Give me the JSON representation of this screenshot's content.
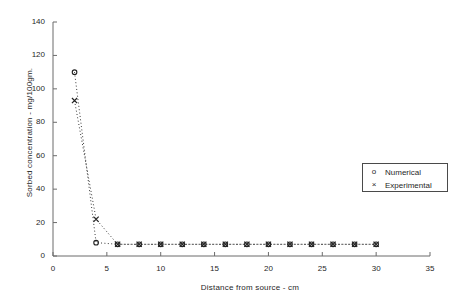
{
  "chart_data": {
    "type": "scatter",
    "title": "",
    "xlabel": "Distance from source  -  cm",
    "ylabel": "Sorbed concentration -  mg/100gm.",
    "xlim": [
      0,
      35
    ],
    "ylim": [
      0,
      140
    ],
    "xticks": [
      0,
      5,
      10,
      15,
      20,
      25,
      30,
      35
    ],
    "yticks": [
      0,
      20,
      40,
      60,
      80,
      100,
      120,
      140
    ],
    "xtick_labels": [
      "0",
      "5",
      "10",
      "15",
      "20",
      "25",
      "30",
      "35"
    ],
    "ytick_labels": [
      "0",
      "20",
      "40",
      "60",
      "80",
      "100",
      "120",
      "140"
    ],
    "grid": false,
    "legend_position": "right-middle",
    "line_style": "dotted",
    "x": [
      2,
      4,
      6,
      8,
      10,
      12,
      14,
      16,
      18,
      20,
      22,
      24,
      26,
      28,
      30
    ],
    "series": [
      {
        "name": "Numerical",
        "marker": "circle",
        "values": [
          110,
          8,
          7,
          7,
          7,
          7,
          7,
          7,
          7,
          7,
          7,
          7,
          7,
          7,
          7
        ]
      },
      {
        "name": "Experimental",
        "marker": "cross",
        "values": [
          93,
          22,
          7,
          7,
          7,
          7,
          7,
          7,
          7,
          7,
          7,
          7,
          7,
          7,
          7
        ]
      }
    ]
  },
  "legend": {
    "items": [
      {
        "symbol": "o",
        "label": "Numerical"
      },
      {
        "symbol": "×",
        "label": "Experimental"
      }
    ]
  },
  "colors": {
    "axis": "#6b6b6b",
    "marker": "#222222",
    "text": "#1f1f1f",
    "background": "#ffffff"
  }
}
